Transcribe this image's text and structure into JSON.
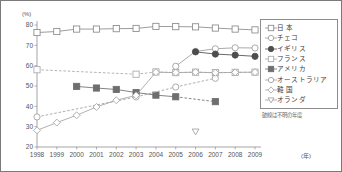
{
  "chart_data": {
    "type": "line",
    "title": "",
    "xlabel": "(年)",
    "ylabel": "(%)",
    "x": [
      1998,
      1999,
      2000,
      2001,
      2002,
      2003,
      2004,
      2005,
      2006,
      2007,
      2008,
      2009
    ],
    "xlim": [
      1998,
      2009
    ],
    "ylim": [
      20,
      80
    ],
    "yticks": [
      20,
      30,
      40,
      50,
      60,
      70,
      80
    ],
    "xticks": [
      "1998",
      "1999",
      "2000",
      "2001",
      "2002",
      "2003",
      "2004",
      "2005",
      "2006",
      "2007",
      "2008",
      "2009"
    ],
    "grid": false,
    "legend_position": "right",
    "note": "破線は不明の年度",
    "series": [
      {
        "name": "日 本",
        "marker": "square-open",
        "color": "#8a8a8a",
        "dashed": false,
        "points": [
          {
            "x": 1998,
            "y": 76.3
          },
          {
            "x": 1999,
            "y": 76.8
          },
          {
            "x": 2000,
            "y": 78.0
          },
          {
            "x": 2001,
            "y": 78.0
          },
          {
            "x": 2002,
            "y": 78.2
          },
          {
            "x": 2003,
            "y": 78.3
          },
          {
            "x": 2004,
            "y": 79.3
          },
          {
            "x": 2005,
            "y": 79.2
          },
          {
            "x": 2006,
            "y": 79.1
          },
          {
            "x": 2007,
            "y": 78.5
          },
          {
            "x": 2008,
            "y": 78.0
          },
          {
            "x": 2009,
            "y": 77.6
          }
        ]
      },
      {
        "name": "チェコ",
        "marker": "circle-open",
        "color": "#9b9b9b",
        "dashed": false,
        "points": [
          {
            "x": 2005,
            "y": 59.7
          },
          {
            "x": 2006,
            "y": 67.0
          },
          {
            "x": 2007,
            "y": 68.3
          },
          {
            "x": 2008,
            "y": 68.8
          },
          {
            "x": 2009,
            "y": 68.7
          }
        ]
      },
      {
        "name": "イギリス",
        "marker": "circle-filled",
        "color": "#4d4d4d",
        "dashed": false,
        "points": [
          {
            "x": 2006,
            "y": 66.8
          },
          {
            "x": 2007,
            "y": 65.7
          },
          {
            "x": 2008,
            "y": 65.2
          },
          {
            "x": 2009,
            "y": 64.6
          }
        ]
      },
      {
        "name": "フランス",
        "marker": "square-open",
        "color": "#a8a8a8",
        "dashed": true,
        "points": [
          {
            "x": 1998,
            "y": 58.0
          },
          {
            "x": 2003,
            "y": 55.8
          },
          {
            "x": 2004,
            "y": 56.9
          },
          {
            "x": 2005,
            "y": 56.6
          },
          {
            "x": 2006,
            "y": 56.8
          },
          {
            "x": 2007,
            "y": 56.6
          },
          {
            "x": 2008,
            "y": 56.7
          },
          {
            "x": 2009,
            "y": 56.8
          }
        ],
        "dashed_until": 2003
      },
      {
        "name": "アメリカ",
        "marker": "square-filled",
        "color": "#6e6e6e",
        "dashed": false,
        "points": [
          {
            "x": 2000,
            "y": 49.8
          },
          {
            "x": 2001,
            "y": 49.0
          },
          {
            "x": 2002,
            "y": 48.3
          },
          {
            "x": 2003,
            "y": 46.8
          },
          {
            "x": 2004,
            "y": 45.5
          },
          {
            "x": 2005,
            "y": 44.7
          },
          {
            "x": 2007,
            "y": 42.3
          }
        ],
        "dashed_from": 2005
      },
      {
        "name": "オーストラリア",
        "marker": "circle-open",
        "color": "#9e9e9e",
        "dashed": true,
        "points": [
          {
            "x": 1998,
            "y": 34.8
          },
          {
            "x": 2003,
            "y": 44.6
          },
          {
            "x": 2005,
            "y": 49.5
          },
          {
            "x": 2007,
            "y": 53.8
          }
        ]
      },
      {
        "name": "韓 国",
        "marker": "diamond-open",
        "color": "#a3a3a3",
        "dashed": false,
        "points": [
          {
            "x": 1998,
            "y": 28.2
          },
          {
            "x": 1999,
            "y": 32.0
          },
          {
            "x": 2000,
            "y": 35.6
          },
          {
            "x": 2001,
            "y": 39.7
          },
          {
            "x": 2002,
            "y": 43.0
          },
          {
            "x": 2003,
            "y": 45.4
          },
          {
            "x": 2004,
            "y": 56.8
          },
          {
            "x": 2005,
            "y": 56.6
          },
          {
            "x": 2006,
            "y": 56.8
          },
          {
            "x": 2007,
            "y": 56.5
          },
          {
            "x": 2008,
            "y": 56.7
          },
          {
            "x": 2009,
            "y": 56.8
          }
        ]
      },
      {
        "name": "オランダ",
        "marker": "triangle-down-open",
        "color": "#a0a0a0",
        "dashed": false,
        "points": [
          {
            "x": 2006,
            "y": 27.6
          }
        ]
      }
    ]
  },
  "legend": {
    "items": [
      {
        "label": "日 本",
        "marker": "square-open",
        "color": "#8a8a8a"
      },
      {
        "label": "チェコ",
        "marker": "circle-open",
        "color": "#9b9b9b"
      },
      {
        "label": "イギリス",
        "marker": "circle-filled",
        "color": "#4d4d4d"
      },
      {
        "label": "フランス",
        "marker": "square-open",
        "color": "#a8a8a8"
      },
      {
        "label": "アメリカ",
        "marker": "square-filled",
        "color": "#6e6e6e"
      },
      {
        "label": "オーストラリア",
        "marker": "circle-open",
        "color": "#9e9e9e"
      },
      {
        "label": "韓 国",
        "marker": "diamond-open",
        "color": "#a3a3a3"
      },
      {
        "label": "オランダ",
        "marker": "triangle-down-open",
        "color": "#a0a0a0"
      }
    ],
    "note": "破線は不明の年度"
  },
  "axes": {
    "y_unit": "(%)",
    "x_unit": "(年)"
  }
}
